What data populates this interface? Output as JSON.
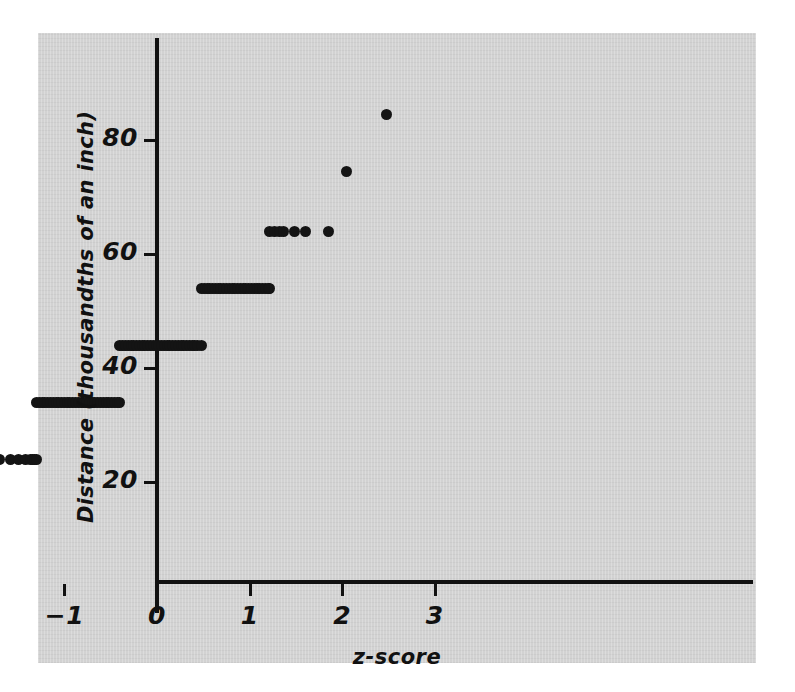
{
  "figure": {
    "panel_color": "#d2d2d2",
    "ink_color": "#141414"
  },
  "chart_data": {
    "type": "scatter",
    "title": "",
    "subtitle": "",
    "xlabel": "z-score",
    "ylabel": "Distance (thousandths of an inch)",
    "xlim": [
      -3.3,
      3.3
    ],
    "ylim": [
      7,
      91
    ],
    "xticks": [
      -3,
      -2,
      -1,
      0,
      1,
      2,
      3
    ],
    "xticklabels": [
      "−3",
      "−2",
      "−1",
      "0",
      "1",
      "2",
      "3"
    ],
    "yticks": [
      20,
      40,
      60,
      80
    ],
    "yticklabels": [
      "20",
      "40",
      "60",
      "80"
    ],
    "grid": false,
    "legend": null,
    "marker": "filled-circle",
    "marker_color": "#141414",
    "bands": [
      {
        "y": 14,
        "z_min": -2.6,
        "z_max": -2.6,
        "count": 1
      },
      {
        "y": 24,
        "z_min": -2.14,
        "z_max": -1.3,
        "count": 11
      },
      {
        "y": 34,
        "z_min": -1.3,
        "z_max": -0.4,
        "count": 34
      },
      {
        "y": 44,
        "z_min": -0.4,
        "z_max": 0.48,
        "count": 34
      },
      {
        "y": 54,
        "z_min": 0.48,
        "z_max": 1.22,
        "count": 28
      },
      {
        "y": 64,
        "z_min": 1.22,
        "z_max": 1.85,
        "count": 8
      },
      {
        "y": 74.5,
        "z_min": 2.05,
        "z_max": 2.05,
        "count": 1
      },
      {
        "y": 84.5,
        "z_min": 2.48,
        "z_max": 2.48,
        "count": 1
      }
    ],
    "points": [
      {
        "z": -2.6,
        "y": 14
      },
      {
        "z": -2.14,
        "y": 24
      },
      {
        "z": -1.93,
        "y": 24
      },
      {
        "z": -1.82,
        "y": 24
      },
      {
        "z": -1.7,
        "y": 24
      },
      {
        "z": -1.58,
        "y": 24
      },
      {
        "z": -1.5,
        "y": 24
      },
      {
        "z": -1.42,
        "y": 24
      },
      {
        "z": -1.37,
        "y": 24
      },
      {
        "z": -1.34,
        "y": 24
      },
      {
        "z": -1.32,
        "y": 24
      },
      {
        "z": -1.3,
        "y": 24
      },
      {
        "z": -1.3,
        "y": 34
      },
      {
        "z": -1.27,
        "y": 34
      },
      {
        "z": -1.24,
        "y": 34
      },
      {
        "z": -1.21,
        "y": 34
      },
      {
        "z": -1.18,
        "y": 34
      },
      {
        "z": -1.15,
        "y": 34
      },
      {
        "z": -1.12,
        "y": 34
      },
      {
        "z": -1.09,
        "y": 34
      },
      {
        "z": -1.06,
        "y": 34
      },
      {
        "z": -1.03,
        "y": 34
      },
      {
        "z": -1.0,
        "y": 34
      },
      {
        "z": -0.97,
        "y": 34
      },
      {
        "z": -0.94,
        "y": 34
      },
      {
        "z": -0.91,
        "y": 34
      },
      {
        "z": -0.88,
        "y": 34
      },
      {
        "z": -0.85,
        "y": 34
      },
      {
        "z": -0.82,
        "y": 34
      },
      {
        "z": -0.79,
        "y": 34
      },
      {
        "z": -0.76,
        "y": 34
      },
      {
        "z": -0.73,
        "y": 34
      },
      {
        "z": -0.7,
        "y": 34
      },
      {
        "z": -0.67,
        "y": 34
      },
      {
        "z": -0.64,
        "y": 34
      },
      {
        "z": -0.61,
        "y": 34
      },
      {
        "z": -0.58,
        "y": 34
      },
      {
        "z": -0.55,
        "y": 34
      },
      {
        "z": -0.52,
        "y": 34
      },
      {
        "z": -0.49,
        "y": 34
      },
      {
        "z": -0.46,
        "y": 34
      },
      {
        "z": -0.43,
        "y": 34
      },
      {
        "z": -0.4,
        "y": 34
      },
      {
        "z": -0.4,
        "y": 44
      },
      {
        "z": -0.37,
        "y": 44
      },
      {
        "z": -0.34,
        "y": 44
      },
      {
        "z": -0.31,
        "y": 44
      },
      {
        "z": -0.28,
        "y": 44
      },
      {
        "z": -0.25,
        "y": 44
      },
      {
        "z": -0.22,
        "y": 44
      },
      {
        "z": -0.19,
        "y": 44
      },
      {
        "z": -0.16,
        "y": 44
      },
      {
        "z": -0.13,
        "y": 44
      },
      {
        "z": -0.1,
        "y": 44
      },
      {
        "z": -0.07,
        "y": 44
      },
      {
        "z": -0.04,
        "y": 44
      },
      {
        "z": -0.01,
        "y": 44
      },
      {
        "z": 0.02,
        "y": 44
      },
      {
        "z": 0.05,
        "y": 44
      },
      {
        "z": 0.08,
        "y": 44
      },
      {
        "z": 0.11,
        "y": 44
      },
      {
        "z": 0.14,
        "y": 44
      },
      {
        "z": 0.17,
        "y": 44
      },
      {
        "z": 0.2,
        "y": 44
      },
      {
        "z": 0.23,
        "y": 44
      },
      {
        "z": 0.26,
        "y": 44
      },
      {
        "z": 0.29,
        "y": 44
      },
      {
        "z": 0.32,
        "y": 44
      },
      {
        "z": 0.35,
        "y": 44
      },
      {
        "z": 0.38,
        "y": 44
      },
      {
        "z": 0.41,
        "y": 44
      },
      {
        "z": 0.44,
        "y": 44
      },
      {
        "z": 0.48,
        "y": 44
      },
      {
        "z": 0.48,
        "y": 54
      },
      {
        "z": 0.51,
        "y": 54
      },
      {
        "z": 0.54,
        "y": 54
      },
      {
        "z": 0.57,
        "y": 54
      },
      {
        "z": 0.6,
        "y": 54
      },
      {
        "z": 0.63,
        "y": 54
      },
      {
        "z": 0.66,
        "y": 54
      },
      {
        "z": 0.69,
        "y": 54
      },
      {
        "z": 0.72,
        "y": 54
      },
      {
        "z": 0.75,
        "y": 54
      },
      {
        "z": 0.78,
        "y": 54
      },
      {
        "z": 0.81,
        "y": 54
      },
      {
        "z": 0.84,
        "y": 54
      },
      {
        "z": 0.87,
        "y": 54
      },
      {
        "z": 0.9,
        "y": 54
      },
      {
        "z": 0.93,
        "y": 54
      },
      {
        "z": 0.96,
        "y": 54
      },
      {
        "z": 0.99,
        "y": 54
      },
      {
        "z": 1.02,
        "y": 54
      },
      {
        "z": 1.05,
        "y": 54
      },
      {
        "z": 1.08,
        "y": 54
      },
      {
        "z": 1.11,
        "y": 54
      },
      {
        "z": 1.14,
        "y": 54
      },
      {
        "z": 1.17,
        "y": 54
      },
      {
        "z": 1.2,
        "y": 54
      },
      {
        "z": 1.22,
        "y": 54
      },
      {
        "z": 1.22,
        "y": 64
      },
      {
        "z": 1.27,
        "y": 64
      },
      {
        "z": 1.32,
        "y": 64
      },
      {
        "z": 1.37,
        "y": 64
      },
      {
        "z": 1.49,
        "y": 64
      },
      {
        "z": 1.6,
        "y": 64
      },
      {
        "z": 1.85,
        "y": 64
      },
      {
        "z": 2.05,
        "y": 74.5
      },
      {
        "z": 2.48,
        "y": 84.5
      }
    ]
  }
}
